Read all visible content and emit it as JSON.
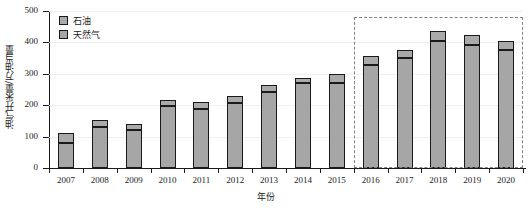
{
  "chart_data": {
    "type": "bar",
    "subtype": "stacked-bar",
    "title": "",
    "xlabel": "年份",
    "ylabel": "油气开采量/万油当量",
    "ylim": [
      0,
      500
    ],
    "yticks": [
      0,
      100,
      200,
      300,
      400,
      500
    ],
    "grid": true,
    "grid_axis": "y",
    "legend_position": "top-left",
    "categories": [
      "2007",
      "2008",
      "2009",
      "2010",
      "2011",
      "2012",
      "2013",
      "2014",
      "2015",
      "2016",
      "2017",
      "2018",
      "2019",
      "2020"
    ],
    "series": [
      {
        "name": "天然气",
        "stack_order": 0,
        "color": "#a6a6a6",
        "values": [
          80,
          130,
          122,
          197,
          189,
          206,
          242,
          272,
          271,
          327,
          350,
          406,
          392,
          377
        ]
      },
      {
        "name": "石油",
        "stack_order": 1,
        "color": "#aaaaaa",
        "values": [
          33,
          22,
          17,
          18,
          20,
          22,
          21,
          16,
          27,
          30,
          25,
          30,
          30,
          26
        ]
      }
    ],
    "totals": [
      113,
      152,
      139,
      215,
      209,
      228,
      263,
      288,
      298,
      357,
      375,
      436,
      422,
      403
    ],
    "annotations": [
      {
        "name": "forecast-region",
        "type": "dashed-rectangle",
        "from_category": "2016",
        "to_category": "2020",
        "color": "#808080",
        "label": ""
      }
    ]
  },
  "legend": {
    "items": [
      {
        "label": "石油",
        "swatch": "oil"
      },
      {
        "label": "天然气",
        "swatch": "gas"
      }
    ]
  },
  "axes": {
    "y_title": "油气开采量/万油当量",
    "x_title": "年份",
    "y_tick_labels": [
      "500",
      "400",
      "300",
      "200",
      "100",
      "0"
    ],
    "x_tick_labels": [
      "2007",
      "2008",
      "2009",
      "2010",
      "2011",
      "2012",
      "2013",
      "2014",
      "2015",
      "2016",
      "2017",
      "2018",
      "2019",
      "2020"
    ]
  }
}
